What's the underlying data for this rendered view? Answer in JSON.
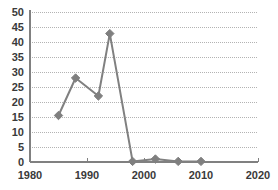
{
  "chart_data": {
    "type": "line",
    "title": "",
    "xlabel": "",
    "ylabel": "",
    "x": [
      1985,
      1988,
      1992,
      1994,
      1998,
      2002,
      2006,
      2010
    ],
    "values": [
      15.5,
      28,
      22,
      42.8,
      0.2,
      1,
      0.2,
      0.2
    ],
    "series": [
      {
        "name": "series-1",
        "x": [
          1985,
          1988,
          1992,
          1994,
          1998,
          2002,
          2006,
          2010
        ],
        "values": [
          15.5,
          28,
          22,
          42.8,
          0.2,
          1,
          0.2,
          0.2
        ]
      }
    ],
    "xlim": [
      1980,
      2020
    ],
    "ylim": [
      0,
      50
    ],
    "xticks": [
      1980,
      1990,
      2000,
      2010,
      2020
    ],
    "xtick_labels": [
      "1980",
      "1990",
      "2000",
      "2010",
      "2020"
    ],
    "yticks": [
      0,
      5,
      10,
      15,
      20,
      25,
      30,
      35,
      40,
      45,
      50
    ],
    "ytick_labels": [
      "0",
      "5",
      "10",
      "15",
      "20",
      "25",
      "30",
      "35",
      "40",
      "45",
      "50"
    ],
    "grid": "horizontal-dotted",
    "legend": "none",
    "marker": "diamond",
    "colors": {
      "line": "#808080",
      "marker": "#7f7f7f",
      "axis": "#808080",
      "gridline": "#b3b3b3",
      "text": "#3a3a3a",
      "background": "#ffffff"
    }
  },
  "axes": {
    "y_axis_name": "value-axis",
    "x_axis_name": "year-axis"
  }
}
